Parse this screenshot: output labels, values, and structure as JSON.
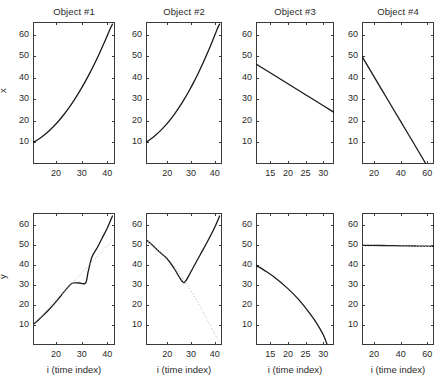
{
  "figure": {
    "rows": 2,
    "cols": 4,
    "background": "#ffffff",
    "line_color": "#1a1a1a",
    "dotted_color": "#b9b9b9",
    "axis_color": "#3a3a3a"
  },
  "titles": [
    "Object #1",
    "Object #2",
    "Object #3",
    "Object #4"
  ],
  "axis_labels": {
    "y_top": "x",
    "y_bottom": "y",
    "x_bottom": "i (time index)"
  },
  "chart_data": [
    {
      "type": "line",
      "title": "Object #1",
      "panel": "top-1",
      "xlabel": "",
      "ylabel": "x",
      "xlim": [
        11,
        43
      ],
      "ylim": [
        0,
        66
      ],
      "xticks": [
        20,
        30,
        40
      ],
      "yticks": [
        10,
        20,
        30,
        40,
        50,
        60
      ],
      "grid": false,
      "series": [
        {
          "name": "x-track",
          "style": "solid",
          "x": [
            11,
            13,
            15,
            17,
            19,
            21,
            23,
            25,
            27,
            29,
            31,
            33,
            35,
            37,
            39,
            41,
            42
          ],
          "y": [
            10,
            11.4,
            13.1,
            15.1,
            17.4,
            20.0,
            22.9,
            26.1,
            29.6,
            33.4,
            37.5,
            41.9,
            46.6,
            51.6,
            56.9,
            62.5,
            65.0
          ]
        }
      ]
    },
    {
      "type": "line",
      "title": "Object #2",
      "panel": "top-2",
      "xlabel": "",
      "ylabel": "",
      "xlim": [
        11,
        43
      ],
      "ylim": [
        0,
        66
      ],
      "xticks": [
        20,
        30,
        40
      ],
      "yticks": [
        10,
        20,
        30,
        40,
        50,
        60
      ],
      "grid": false,
      "series": [
        {
          "name": "x-track",
          "style": "solid",
          "x": [
            11,
            13,
            15,
            17,
            19,
            21,
            23,
            25,
            27,
            29,
            31,
            33,
            35,
            37,
            39,
            41,
            42
          ],
          "y": [
            10,
            11.6,
            13.4,
            15.4,
            17.7,
            20.3,
            23.2,
            26.4,
            29.9,
            33.7,
            37.8,
            42.2,
            46.9,
            51.9,
            57.2,
            62.8,
            65.0
          ]
        }
      ]
    },
    {
      "type": "line",
      "title": "Object #3",
      "panel": "top-3",
      "xlabel": "",
      "ylabel": "",
      "xlim": [
        11,
        33
      ],
      "ylim": [
        0,
        66
      ],
      "xticks": [
        15,
        20,
        25,
        30
      ],
      "yticks": [
        10,
        20,
        30,
        40,
        50,
        60
      ],
      "grid": false,
      "series": [
        {
          "name": "x-track",
          "style": "solid",
          "x": [
            11,
            15,
            20,
            25,
            30,
            33
          ],
          "y": [
            46.5,
            42.4,
            37.3,
            32.2,
            27.1,
            24.0
          ]
        }
      ]
    },
    {
      "type": "line",
      "title": "Object #4",
      "panel": "top-4",
      "xlabel": "",
      "ylabel": "",
      "xlim": [
        11,
        65
      ],
      "ylim": [
        0,
        66
      ],
      "xticks": [
        20,
        40,
        60
      ],
      "yticks": [
        10,
        20,
        30,
        40,
        50,
        60
      ],
      "grid": false,
      "series": [
        {
          "name": "x-track",
          "style": "solid",
          "x": [
            11,
            20,
            30,
            40,
            50,
            59
          ],
          "y": [
            50.0,
            40.6,
            30.2,
            19.8,
            9.4,
            0.0
          ]
        }
      ]
    },
    {
      "type": "line",
      "title": "",
      "panel": "bottom-1",
      "xlabel": "i (time index)",
      "ylabel": "y",
      "xlim": [
        11,
        43
      ],
      "ylim": [
        0,
        66
      ],
      "xticks": [
        20,
        30,
        40
      ],
      "yticks": [
        10,
        20,
        30,
        40,
        50,
        60
      ],
      "grid": false,
      "series": [
        {
          "name": "y-track",
          "style": "solid",
          "x": [
            11,
            13,
            15,
            17,
            19,
            21,
            23,
            25,
            26.5,
            29,
            31.5,
            32.5,
            34,
            36,
            38,
            40,
            42
          ],
          "y": [
            10.2,
            12.4,
            14.8,
            17.4,
            20.2,
            23.2,
            26.4,
            29.4,
            31.0,
            31.0,
            31.0,
            36.5,
            44.0,
            48.5,
            53.5,
            58.5,
            64.5
          ]
        },
        {
          "name": "y-reference",
          "style": "dotted",
          "x": [
            11,
            16,
            21,
            26,
            31,
            36,
            41,
            42
          ],
          "y": [
            10.2,
            17.0,
            23.8,
            30.6,
            37.4,
            44.2,
            51.0,
            52.4
          ]
        }
      ]
    },
    {
      "type": "line",
      "title": "",
      "panel": "bottom-2",
      "xlabel": "i (time index)",
      "ylabel": "",
      "xlim": [
        11,
        43
      ],
      "ylim": [
        0,
        66
      ],
      "xticks": [
        20,
        30,
        40
      ],
      "yticks": [
        10,
        20,
        30,
        40,
        50,
        60
      ],
      "grid": false,
      "series": [
        {
          "name": "y-track",
          "style": "solid",
          "x": [
            11,
            14,
            17,
            20,
            23,
            25,
            27,
            29,
            31,
            34,
            37,
            40,
            42
          ],
          "y": [
            52.8,
            49.6,
            46.2,
            43.0,
            38.0,
            34.0,
            31.2,
            34.6,
            39.0,
            45.5,
            52.0,
            59.0,
            64.5
          ]
        },
        {
          "name": "y-reference",
          "style": "dotted",
          "x": [
            11,
            16,
            21,
            26,
            31,
            36,
            40,
            42
          ],
          "y": [
            52.8,
            47.5,
            42.0,
            34.5,
            25.0,
            14.5,
            5.5,
            1.0
          ]
        }
      ]
    },
    {
      "type": "line",
      "title": "",
      "panel": "bottom-3",
      "xlabel": "i (time index)",
      "ylabel": "",
      "xlim": [
        11,
        33
      ],
      "ylim": [
        0,
        66
      ],
      "xticks": [
        15,
        20,
        25,
        30
      ],
      "yticks": [
        10,
        20,
        30,
        40,
        50,
        60
      ],
      "grid": false,
      "series": [
        {
          "name": "y-track",
          "style": "solid",
          "x": [
            11,
            14,
            17,
            20,
            23,
            26,
            28,
            30,
            31
          ],
          "y": [
            39.8,
            36.6,
            32.8,
            28.2,
            22.8,
            16.2,
            11.2,
            5.0,
            0.5
          ]
        }
      ]
    },
    {
      "type": "line",
      "title": "",
      "panel": "bottom-4",
      "xlabel": "i (time index)",
      "ylabel": "",
      "xlim": [
        11,
        65
      ],
      "ylim": [
        0,
        66
      ],
      "xticks": [
        20,
        40,
        60
      ],
      "yticks": [
        10,
        20,
        30,
        40,
        50,
        60
      ],
      "grid": false,
      "series": [
        {
          "name": "y-track",
          "style": "solid",
          "x": [
            11,
            20,
            30,
            40,
            50,
            60,
            65
          ],
          "y": [
            49.8,
            49.8,
            49.7,
            49.6,
            49.5,
            49.4,
            49.3
          ]
        },
        {
          "name": "y-reference",
          "style": "dotted",
          "x": [
            11,
            20,
            30,
            40,
            50,
            60,
            65
          ],
          "y": [
            49.3,
            49.3,
            49.3,
            49.3,
            49.3,
            49.3,
            49.3
          ]
        }
      ]
    }
  ]
}
